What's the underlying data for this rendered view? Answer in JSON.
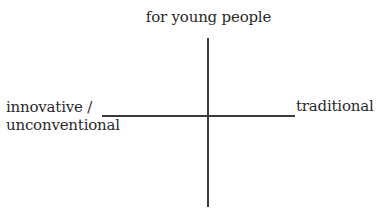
{
  "diagram": {
    "type": "perceptual-map",
    "axes": {
      "vertical": {
        "top_label": "for young people",
        "bottom_label": ""
      },
      "horizontal": {
        "left_label": "innovative /\nunconventional",
        "right_label": "traditional"
      }
    },
    "colors": {
      "line": "#3a3a3a",
      "text": "#2a2a2a",
      "background": "#ffffff"
    }
  }
}
